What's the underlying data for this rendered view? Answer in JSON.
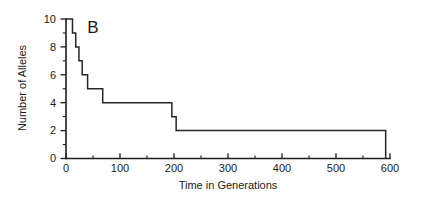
{
  "chart_data": {
    "type": "line",
    "title": "",
    "panel_label": "B",
    "xlabel": "Time in Generations",
    "ylabel": "Number of Alleles",
    "xlim": [
      0,
      620
    ],
    "ylim": [
      0,
      10.4
    ],
    "grid": false,
    "legend": null,
    "x_ticks": [
      0,
      100,
      200,
      300,
      400,
      500,
      600
    ],
    "x_tick_labels": [
      "0",
      "100",
      "200",
      "300",
      "400",
      "500",
      "600"
    ],
    "x_minor_ticks": [
      50,
      150,
      250,
      350,
      450,
      550
    ],
    "y_ticks": [
      0,
      2,
      4,
      6,
      8,
      10
    ],
    "y_tick_labels": [
      "0",
      "2",
      "4",
      "6",
      "8",
      "10"
    ],
    "y_minor_ticks": [
      1,
      3,
      5,
      7,
      9
    ],
    "series": [
      {
        "name": "Number of Alleles",
        "step": "post",
        "x": [
          0,
          12,
          18,
          24,
          30,
          40,
          68,
          196,
          204,
          592,
          592
        ],
        "y": [
          10,
          9,
          8,
          7,
          6,
          5,
          4,
          3,
          2,
          2,
          0
        ],
        "points": [
          {
            "generation": 0,
            "alleles": 10
          },
          {
            "generation": 12,
            "alleles": 9
          },
          {
            "generation": 18,
            "alleles": 8
          },
          {
            "generation": 24,
            "alleles": 7
          },
          {
            "generation": 30,
            "alleles": 6
          },
          {
            "generation": 40,
            "alleles": 5
          },
          {
            "generation": 68,
            "alleles": 4
          },
          {
            "generation": 196,
            "alleles": 3
          },
          {
            "generation": 204,
            "alleles": 2
          },
          {
            "generation": 592,
            "alleles": 2
          },
          {
            "generation": 592,
            "alleles": 0
          }
        ]
      }
    ],
    "line_color": "#262626",
    "axis_color": "#1d1d1d",
    "background": "#ffffff"
  },
  "axes": {
    "x_title": "Time in Generations",
    "y_title": "Number of Alleles"
  },
  "labels": {
    "panel": "B",
    "x0": "0",
    "x100": "100",
    "x200": "200",
    "x300": "300",
    "x400": "400",
    "x500": "500",
    "x600": "600",
    "y0": "0",
    "y2": "2",
    "y4": "4",
    "y6": "6",
    "y8": "8",
    "y10": "10"
  }
}
